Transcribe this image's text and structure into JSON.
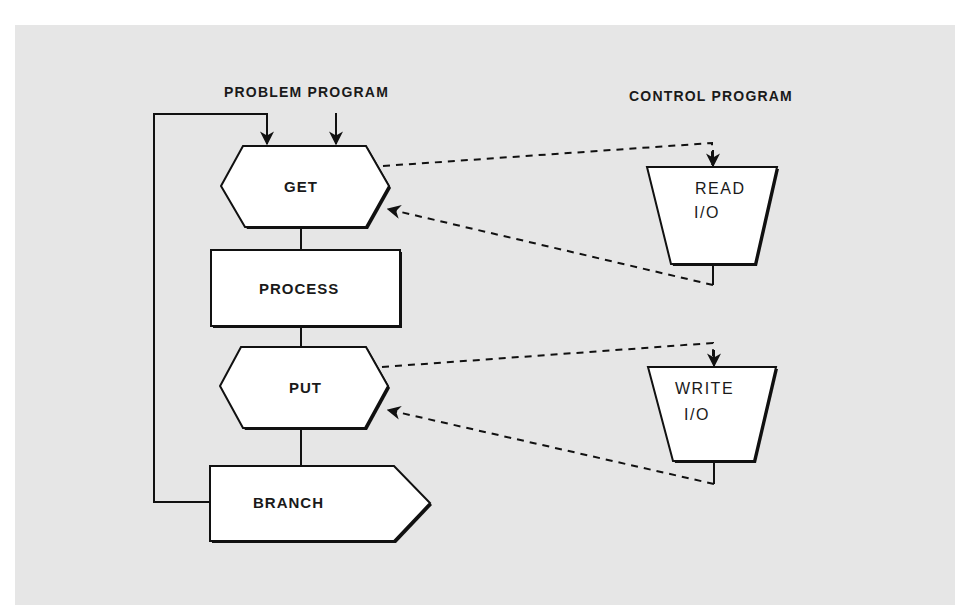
{
  "headings": {
    "problem_program": "PROBLEM PROGRAM",
    "control_program": "CONTROL PROGRAM"
  },
  "nodes": {
    "get": {
      "label": "GET",
      "shape": "hexagon"
    },
    "process": {
      "label": "PROCESS",
      "shape": "rectangle"
    },
    "put": {
      "label": "PUT",
      "shape": "hexagon"
    },
    "branch": {
      "label": "BRANCH",
      "shape": "pentagon-arrow"
    },
    "read_io": {
      "line1": "READ",
      "line2": "I/O",
      "shape": "trapezoid"
    },
    "write_io": {
      "line1": "WRITE",
      "line2": "I/O",
      "shape": "trapezoid"
    }
  },
  "edges": [
    {
      "from": "branch",
      "to": "get",
      "style": "solid",
      "note": "loop back"
    },
    {
      "from": "entry",
      "to": "get",
      "style": "solid"
    },
    {
      "from": "get",
      "to": "process",
      "style": "solid"
    },
    {
      "from": "process",
      "to": "put",
      "style": "solid"
    },
    {
      "from": "put",
      "to": "branch",
      "style": "solid"
    },
    {
      "from": "get",
      "to": "read_io",
      "style": "dashed"
    },
    {
      "from": "read_io",
      "to": "get",
      "style": "dashed"
    },
    {
      "from": "put",
      "to": "write_io",
      "style": "dashed"
    },
    {
      "from": "write_io",
      "to": "put",
      "style": "dashed"
    }
  ],
  "colors": {
    "background": "#e6e6e6",
    "shape_fill": "#ffffff",
    "stroke": "#111111"
  }
}
